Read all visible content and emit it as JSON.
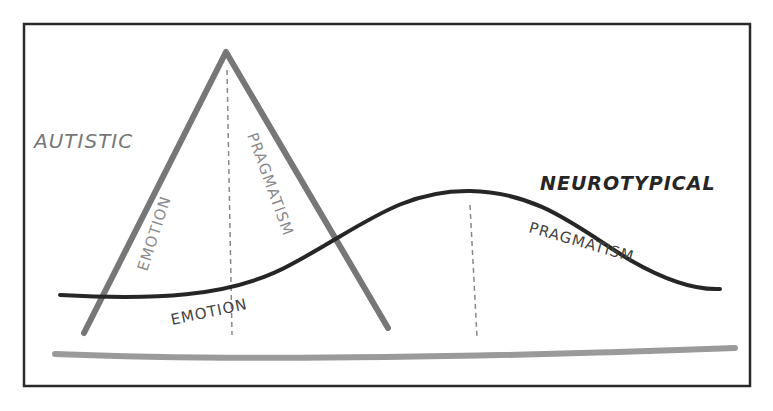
{
  "diagram": {
    "labels": {
      "autistic": "AUTISTIC",
      "neurotypical": "NEUROTYPICAL",
      "autistic_emotion": "EMOTION",
      "autistic_pragmatism": "PRAGMATISM",
      "nt_emotion": "EMOTION",
      "nt_pragmatism": "PRAGMATISM"
    },
    "colors": {
      "frame": "#2a2a2a",
      "triangle": "#777777",
      "curve": "#262626",
      "baseline": "#9a9a9a",
      "dashed": "#888888",
      "autistic_text": "#777777",
      "neurotypical_text": "#262626",
      "inner_text_light": "#8a8a8a",
      "inner_text_dark": "#444444"
    }
  }
}
